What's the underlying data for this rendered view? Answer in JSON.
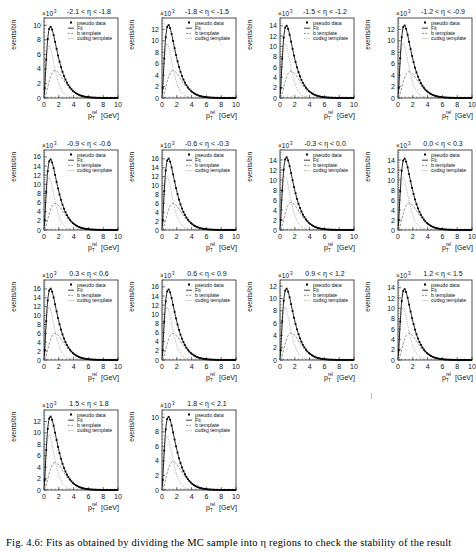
{
  "figure": {
    "caption": "Fig. 4.6: Fits as obtained by dividing the MC sample into η regions to check the stability of the result"
  },
  "common": {
    "xlabel": "p_T^{rel} [GeV]",
    "xlabel_main": "p",
    "xlabel_sub": "T",
    "xlabel_sup": "rel",
    "xlabel_unit": "[GeV]",
    "ylabel": "events/bin",
    "yexp": "×10",
    "yexp_power": "3",
    "xticks": [
      "0",
      "2",
      "4",
      "6",
      "8",
      "10"
    ],
    "legend": [
      "pseudo data",
      "Fit",
      "b template",
      "cudsg template"
    ]
  },
  "chart_data": [
    {
      "type": "line",
      "title": "-2.1 < η < -1.8",
      "xlabel": "p_T^rel [GeV]",
      "ylabel": "events/bin",
      "xlim": [
        0,
        10
      ],
      "ylim": [
        0,
        11
      ],
      "yscale": "×10^3",
      "yticks": [
        0,
        2,
        4,
        6,
        8,
        10
      ],
      "peak": {
        "x": 0.7,
        "data": 10.2,
        "b": 3.8,
        "cudsg": 7.2
      },
      "legend": [
        "pseudo data",
        "Fit",
        "b template",
        "cudsg template"
      ]
    },
    {
      "type": "line",
      "title": "-1.8 < η < -1.5",
      "xlabel": "p_T^rel [GeV]",
      "ylabel": "events/bin",
      "xlim": [
        0,
        10
      ],
      "ylim": [
        0,
        14
      ],
      "yscale": "×10^3",
      "yticks": [
        0,
        2,
        4,
        6,
        8,
        10,
        12
      ],
      "peak": {
        "x": 0.7,
        "data": 13.2,
        "b": 4.8,
        "cudsg": 9.5
      },
      "legend": [
        "pseudo data",
        "Fit",
        "b template",
        "cudsg template"
      ]
    },
    {
      "type": "line",
      "title": "-1.5 < η < -1.2",
      "xlabel": "p_T^rel [GeV]",
      "ylabel": "events/bin",
      "xlim": [
        0,
        10
      ],
      "ylim": [
        0,
        15.5
      ],
      "yscale": "×10^3",
      "yticks": [
        0,
        2,
        4,
        6,
        8,
        10,
        12,
        14
      ],
      "peak": {
        "x": 0.7,
        "data": 14.5,
        "b": 5.2,
        "cudsg": 10.5
      },
      "legend": [
        "pseudo data",
        "Fit",
        "b template",
        "cudsg template"
      ]
    },
    {
      "type": "line",
      "title": "-1.2 < η < -0.9",
      "xlabel": "p_T^rel [GeV]",
      "ylabel": "events/bin",
      "xlim": [
        0,
        10
      ],
      "ylim": [
        0,
        14
      ],
      "yscale": "×10^3",
      "yticks": [
        0,
        2,
        4,
        6,
        8,
        10,
        12
      ],
      "peak": {
        "x": 0.7,
        "data": 13.2,
        "b": 4.6,
        "cudsg": 9.6
      },
      "legend": [
        "pseudo data",
        "Fit",
        "b template",
        "cudsg template"
      ]
    },
    {
      "type": "line",
      "title": "-0.9 < η < -0.6",
      "xlabel": "p_T^rel [GeV]",
      "ylabel": "events/bin",
      "xlim": [
        0,
        10
      ],
      "ylim": [
        0,
        17.5
      ],
      "yscale": "×10^3",
      "yticks": [
        0,
        2,
        4,
        6,
        8,
        10,
        12,
        14,
        16
      ],
      "peak": {
        "x": 0.7,
        "data": 16.2,
        "b": 5.8,
        "cudsg": 11.5
      },
      "legend": [
        "pseudo data",
        "Fit",
        "b template",
        "cudsg template"
      ]
    },
    {
      "type": "line",
      "title": "-0.6 < η < -0.3",
      "xlabel": "p_T^rel [GeV]",
      "ylabel": "events/bin",
      "xlim": [
        0,
        10
      ],
      "ylim": [
        0,
        18
      ],
      "yscale": "×10^3",
      "yticks": [
        0,
        2,
        4,
        6,
        8,
        10,
        12,
        14,
        16
      ],
      "peak": {
        "x": 0.7,
        "data": 16.8,
        "b": 6.0,
        "cudsg": 12.0
      },
      "legend": [
        "pseudo data",
        "Fit",
        "b template",
        "cudsg template"
      ]
    },
    {
      "type": "line",
      "title": "-0.3 < η < 0.0",
      "xlabel": "p_T^rel [GeV]",
      "ylabel": "events/bin",
      "xlim": [
        0,
        10
      ],
      "ylim": [
        0,
        16
      ],
      "yscale": "×10^3",
      "yticks": [
        0,
        2,
        4,
        6,
        8,
        10,
        12,
        14
      ],
      "peak": {
        "x": 0.7,
        "data": 15.0,
        "b": 5.5,
        "cudsg": 10.8
      },
      "legend": [
        "pseudo data",
        "Fit",
        "b template",
        "cudsg template"
      ]
    },
    {
      "type": "line",
      "title": "0.0 < η < 0.3",
      "xlabel": "p_T^rel [GeV]",
      "ylabel": "events/bin",
      "xlim": [
        0,
        10
      ],
      "ylim": [
        0,
        16
      ],
      "yscale": "×10^3",
      "yticks": [
        0,
        2,
        4,
        6,
        8,
        10,
        12,
        14
      ],
      "peak": {
        "x": 0.7,
        "data": 14.8,
        "b": 5.4,
        "cudsg": 10.6
      },
      "legend": [
        "pseudo data",
        "Fit",
        "b template",
        "cudsg template"
      ]
    },
    {
      "type": "line",
      "title": "0.3 < η < 0.6",
      "xlabel": "p_T^rel [GeV]",
      "ylabel": "events/bin",
      "xlim": [
        0,
        10
      ],
      "ylim": [
        0,
        18
      ],
      "yscale": "×10^3",
      "yticks": [
        0,
        2,
        4,
        6,
        8,
        10,
        12,
        14,
        16
      ],
      "peak": {
        "x": 0.7,
        "data": 16.8,
        "b": 6.0,
        "cudsg": 12.0
      },
      "legend": [
        "pseudo data",
        "Fit",
        "b template",
        "cudsg template"
      ]
    },
    {
      "type": "line",
      "title": "0.6 < η < 0.9",
      "xlabel": "p_T^rel [GeV]",
      "ylabel": "events/bin",
      "xlim": [
        0,
        10
      ],
      "ylim": [
        0,
        17.5
      ],
      "yscale": "×10^3",
      "yticks": [
        0,
        2,
        4,
        6,
        8,
        10,
        12,
        14,
        16
      ],
      "peak": {
        "x": 0.7,
        "data": 16.2,
        "b": 5.8,
        "cudsg": 11.5
      },
      "legend": [
        "pseudo data",
        "Fit",
        "b template",
        "cudsg template"
      ]
    },
    {
      "type": "line",
      "title": "0.9 < η < 1.2",
      "xlabel": "p_T^rel [GeV]",
      "ylabel": "events/bin",
      "xlim": [
        0,
        10
      ],
      "ylim": [
        0,
        13
      ],
      "yscale": "×10^3",
      "yticks": [
        0,
        2,
        4,
        6,
        8,
        10,
        12
      ],
      "peak": {
        "x": 0.7,
        "data": 12.0,
        "b": 4.4,
        "cudsg": 8.6
      },
      "legend": [
        "pseudo data",
        "Fit",
        "b template",
        "cudsg template"
      ]
    },
    {
      "type": "line",
      "title": "1.2 < η < 1.5",
      "xlabel": "p_T^rel [GeV]",
      "ylabel": "events/bin",
      "xlim": [
        0,
        10
      ],
      "ylim": [
        0,
        15.5
      ],
      "yscale": "×10^3",
      "yticks": [
        0,
        2,
        4,
        6,
        8,
        10,
        12,
        14
      ],
      "peak": {
        "x": 0.7,
        "data": 14.3,
        "b": 5.2,
        "cudsg": 10.2
      },
      "legend": [
        "pseudo data",
        "Fit",
        "b template",
        "cudsg template"
      ]
    },
    {
      "type": "line",
      "title": "1.5 < η < 1.8",
      "xlabel": "p_T^rel [GeV]",
      "ylabel": "events/bin",
      "xlim": [
        0,
        10
      ],
      "ylim": [
        0,
        14
      ],
      "yscale": "×10^3",
      "yticks": [
        0,
        2,
        4,
        6,
        8,
        10,
        12
      ],
      "peak": {
        "x": 0.7,
        "data": 13.2,
        "b": 4.8,
        "cudsg": 9.6
      },
      "legend": [
        "pseudo data",
        "Fit",
        "b template",
        "cudsg template"
      ]
    },
    {
      "type": "line",
      "title": "1.8 < η < 2.1",
      "xlabel": "p_T^rel [GeV]",
      "ylabel": "events/bin",
      "xlim": [
        0,
        10
      ],
      "ylim": [
        0,
        11
      ],
      "yscale": "×10^3",
      "yticks": [
        0,
        2,
        4,
        6,
        8,
        10
      ],
      "peak": {
        "x": 0.7,
        "data": 10.3,
        "b": 3.9,
        "cudsg": 7.4
      },
      "legend": [
        "pseudo data",
        "Fit",
        "b template",
        "cudsg template"
      ]
    }
  ]
}
